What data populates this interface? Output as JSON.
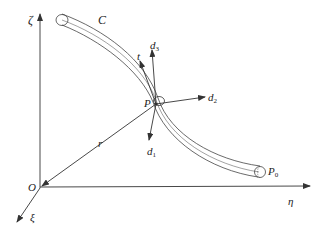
{
  "diagram": {
    "type": "rod-coordinate-frame",
    "colors": {
      "stroke": "#333333",
      "background": "#ffffff"
    },
    "axes": {
      "zeta": {
        "label": "ζ"
      },
      "eta": {
        "label": "η"
      },
      "xi": {
        "label": "ξ"
      }
    },
    "origin": {
      "label": "O"
    },
    "curve": {
      "label": "C"
    },
    "point_p": {
      "label": "P"
    },
    "point_p0": {
      "label": "P",
      "subscript": "0"
    },
    "position_vector": {
      "label": "r"
    },
    "tangent": {
      "label": "t"
    },
    "directors": [
      {
        "label": "d",
        "subscript": "1"
      },
      {
        "label": "d",
        "subscript": "2"
      },
      {
        "label": "d",
        "subscript": "3"
      }
    ]
  }
}
